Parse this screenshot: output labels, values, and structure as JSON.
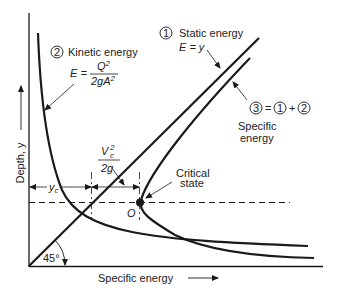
{
  "diagram": {
    "type": "specific-energy-diagram",
    "axes": {
      "y_label": "Depth, y",
      "x_label": "Specific energy",
      "angle_label": "45°"
    },
    "curves": {
      "static": {
        "number": "1",
        "title": "Static energy",
        "equation": "E = y"
      },
      "kinetic": {
        "number": "2",
        "title": "Kinetic energy",
        "equation_lhs": "E =",
        "numerator": "Q",
        "numerator_exp": "2",
        "denominator": "2gA",
        "denominator_exp": "2"
      },
      "specific": {
        "number": "3",
        "equals": "=",
        "term1": "1",
        "plus": "+",
        "term2": "2",
        "title_line1": "Specific",
        "title_line2": "energy"
      }
    },
    "annotations": {
      "critical_line1": "Critical",
      "critical_line2": "state",
      "critical_point": "O",
      "yc_label": "y",
      "yc_sub": "c",
      "velocity_head_num": "V",
      "velocity_head_sub": "c",
      "velocity_head_exp": "2",
      "velocity_head_den": "2g"
    },
    "colors": {
      "line": "#1a1a1a",
      "text": "#222222",
      "background": "#ffffff"
    }
  }
}
